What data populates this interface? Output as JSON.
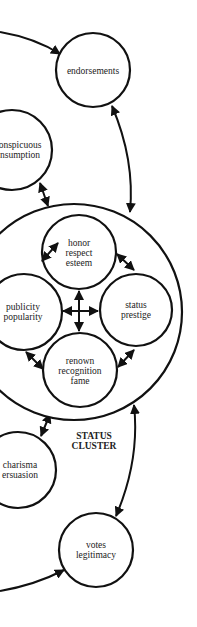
{
  "diagram": {
    "cluster_title": [
      "STATUS",
      "CLUSTER"
    ],
    "nodes": {
      "endorsements": [
        "endorsements"
      ],
      "conspicuous": [
        "onspicuous",
        "nsumption"
      ],
      "honor": [
        "honor",
        "respect",
        "esteem"
      ],
      "publicity": [
        "publicity",
        "popularity"
      ],
      "status": [
        "status",
        "prestige"
      ],
      "renown": [
        "renown",
        "recognition",
        "fame"
      ],
      "charisma": [
        "charisma",
        "ersuasion"
      ],
      "votes": [
        "votes",
        "legitimacy"
      ]
    },
    "colors": {
      "stroke": "#111111",
      "background": "#ffffff",
      "text": "#222222"
    }
  }
}
